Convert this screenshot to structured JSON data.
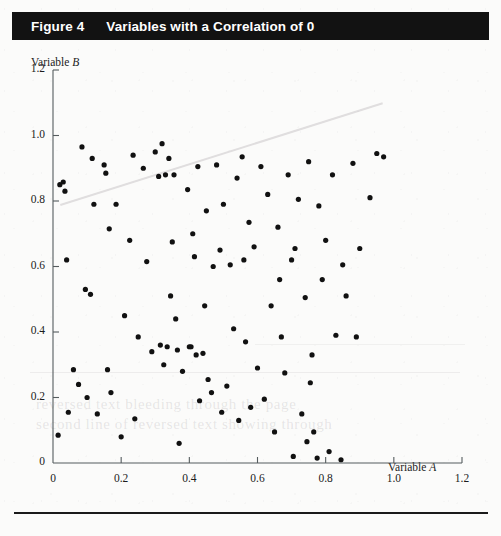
{
  "figure": {
    "number_label": "Figure 4",
    "title": "Variables with a Correlation of 0"
  },
  "chart_data": {
    "type": "scatter",
    "title": "Variables with a Correlation of 0",
    "xlabel": "Variable A",
    "ylabel": "Variable B",
    "xlim": [
      0,
      1.2
    ],
    "ylim": [
      0,
      1.2
    ],
    "xticks": [
      "0",
      "0.2",
      "0.4",
      "0.6",
      "0.8",
      "1.0",
      "1.2"
    ],
    "yticks": [
      "0",
      "0.2",
      "0.4",
      "0.6",
      "0.8",
      "1.0",
      "1.2"
    ],
    "xtick_values": [
      0,
      0.2,
      0.4,
      0.6,
      0.8,
      1.0,
      1.2
    ],
    "ytick_values": [
      0,
      0.2,
      0.4,
      0.6,
      0.8,
      1.0,
      1.2
    ],
    "grid": false,
    "legend": false,
    "marker": "filled-circle",
    "marker_color": "#111111",
    "marker_size_px": 5.2,
    "correlation": 0,
    "n_points": 112,
    "points": [
      [
        0.015,
        0.085
      ],
      [
        0.02,
        0.85
      ],
      [
        0.03,
        0.858
      ],
      [
        0.035,
        0.83
      ],
      [
        0.04,
        0.62
      ],
      [
        0.045,
        0.155
      ],
      [
        0.06,
        0.285
      ],
      [
        0.075,
        0.24
      ],
      [
        0.085,
        0.965
      ],
      [
        0.095,
        0.53
      ],
      [
        0.1,
        0.2
      ],
      [
        0.11,
        0.515
      ],
      [
        0.115,
        0.93
      ],
      [
        0.12,
        0.79
      ],
      [
        0.13,
        0.15
      ],
      [
        0.15,
        0.91
      ],
      [
        0.155,
        0.885
      ],
      [
        0.16,
        0.285
      ],
      [
        0.165,
        0.715
      ],
      [
        0.17,
        0.215
      ],
      [
        0.185,
        0.79
      ],
      [
        0.2,
        0.08
      ],
      [
        0.21,
        0.45
      ],
      [
        0.225,
        0.68
      ],
      [
        0.235,
        0.94
      ],
      [
        0.24,
        0.135
      ],
      [
        0.25,
        0.385
      ],
      [
        0.265,
        0.9
      ],
      [
        0.275,
        0.615
      ],
      [
        0.29,
        0.34
      ],
      [
        0.3,
        0.95
      ],
      [
        0.31,
        0.875
      ],
      [
        0.315,
        0.36
      ],
      [
        0.32,
        0.975
      ],
      [
        0.325,
        0.3
      ],
      [
        0.33,
        0.88
      ],
      [
        0.335,
        0.355
      ],
      [
        0.34,
        0.93
      ],
      [
        0.345,
        0.51
      ],
      [
        0.35,
        0.675
      ],
      [
        0.355,
        0.88
      ],
      [
        0.36,
        0.44
      ],
      [
        0.365,
        0.345
      ],
      [
        0.37,
        0.06
      ],
      [
        0.38,
        0.28
      ],
      [
        0.395,
        0.835
      ],
      [
        0.4,
        0.355
      ],
      [
        0.405,
        0.355
      ],
      [
        0.41,
        0.7
      ],
      [
        0.415,
        0.63
      ],
      [
        0.42,
        0.33
      ],
      [
        0.425,
        0.905
      ],
      [
        0.43,
        0.19
      ],
      [
        0.44,
        0.335
      ],
      [
        0.445,
        0.48
      ],
      [
        0.45,
        0.77
      ],
      [
        0.455,
        0.255
      ],
      [
        0.465,
        0.215
      ],
      [
        0.47,
        0.6
      ],
      [
        0.48,
        0.91
      ],
      [
        0.49,
        0.65
      ],
      [
        0.495,
        0.155
      ],
      [
        0.5,
        0.79
      ],
      [
        0.51,
        0.235
      ],
      [
        0.52,
        0.605
      ],
      [
        0.53,
        0.41
      ],
      [
        0.54,
        0.87
      ],
      [
        0.545,
        0.13
      ],
      [
        0.555,
        0.935
      ],
      [
        0.56,
        0.62
      ],
      [
        0.565,
        0.37
      ],
      [
        0.575,
        0.735
      ],
      [
        0.58,
        0.17
      ],
      [
        0.59,
        0.66
      ],
      [
        0.6,
        0.29
      ],
      [
        0.61,
        0.905
      ],
      [
        0.62,
        0.195
      ],
      [
        0.63,
        0.82
      ],
      [
        0.64,
        0.48
      ],
      [
        0.65,
        0.095
      ],
      [
        0.66,
        0.72
      ],
      [
        0.665,
        0.56
      ],
      [
        0.67,
        0.385
      ],
      [
        0.68,
        0.275
      ],
      [
        0.69,
        0.88
      ],
      [
        0.7,
        0.62
      ],
      [
        0.705,
        0.02
      ],
      [
        0.71,
        0.655
      ],
      [
        0.72,
        0.805
      ],
      [
        0.73,
        0.15
      ],
      [
        0.74,
        0.505
      ],
      [
        0.745,
        0.065
      ],
      [
        0.75,
        0.92
      ],
      [
        0.755,
        0.245
      ],
      [
        0.76,
        0.33
      ],
      [
        0.765,
        0.095
      ],
      [
        0.775,
        0.015
      ],
      [
        0.78,
        0.785
      ],
      [
        0.79,
        0.56
      ],
      [
        0.8,
        0.68
      ],
      [
        0.81,
        0.035
      ],
      [
        0.82,
        0.88
      ],
      [
        0.83,
        0.39
      ],
      [
        0.845,
        0.01
      ],
      [
        0.85,
        0.605
      ],
      [
        0.86,
        0.51
      ],
      [
        0.88,
        0.915
      ],
      [
        0.89,
        0.385
      ],
      [
        0.9,
        0.655
      ],
      [
        0.93,
        0.81
      ],
      [
        0.95,
        0.945
      ],
      [
        0.97,
        0.935
      ]
    ]
  },
  "bleed_through": {
    "line_1": "the faint diagonal stroke and ghost text are show-through",
    "text_1": "reversed text bleeding through the page",
    "text_2": "second line of reversed text showing through"
  }
}
